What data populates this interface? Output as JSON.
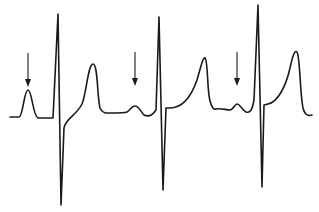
{
  "figure": {
    "type": "ecg-rhythm-strip",
    "colors": {
      "trace": "#1a1a1a",
      "background": "#ffffff"
    },
    "beats": [
      {
        "index": 1,
        "p_wave": "tall",
        "arrow": true
      },
      {
        "index": 2,
        "p_wave": "small",
        "arrow": true
      },
      {
        "index": 3,
        "p_wave": "small",
        "arrow": true
      }
    ],
    "arrows": [
      {
        "x": 28,
        "y1": 53,
        "y2": 86
      },
      {
        "x": 135,
        "y1": 52,
        "y2": 85
      },
      {
        "x": 237,
        "y1": 52,
        "y2": 85
      }
    ]
  }
}
